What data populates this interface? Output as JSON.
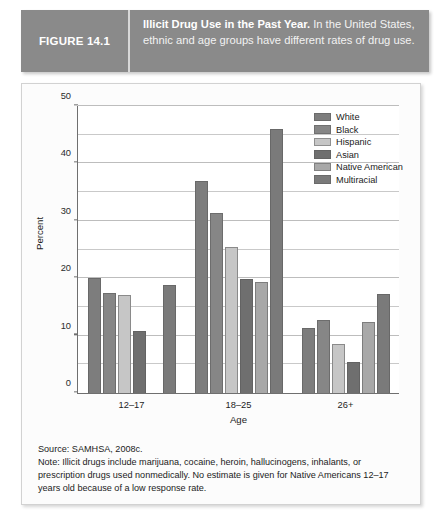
{
  "figure": {
    "label": "FIGURE 14.1",
    "caption_title": "Illicit Drug Use in the Past Year.",
    "caption_body": " In the United States, ethnic and age groups have different rates of drug use.",
    "source": "Source: SAMHSA, 2008c.",
    "note": "Note: Illicit drugs include marijuana, cocaine, heroin, hallucinogens, inhalants, or prescription drugs used nonmedically. No estimate is given for Native Americans 12–17 years old because of a low response rate."
  },
  "colors": {
    "header_band": "#8a8a8a",
    "white_series": "#7d7d7d",
    "black_series": "#868686",
    "hispanic_series": "#c6c6c6",
    "asian_series": "#6f6f6f",
    "native_american_series": "#a8a8a8",
    "multiracial_series": "#7a7a7a",
    "axis": "#6f6f6f",
    "gridline": "#c9c9c9"
  },
  "chart_data": {
    "type": "bar",
    "title": "Illicit Drug Use in the Past Year",
    "xlabel": "Age",
    "ylabel": "Percent",
    "categories": [
      "12–17",
      "18–25",
      "26+"
    ],
    "ylim": [
      0,
      50
    ],
    "yticks": [
      0,
      10,
      20,
      30,
      40,
      50
    ],
    "yticks_minor": [
      5,
      15,
      25,
      35,
      45
    ],
    "grid": true,
    "legend_position": "top-right",
    "series": [
      {
        "name": "White",
        "color": "#7d7d7d",
        "values": [
          20.0,
          36.9,
          11.4
        ]
      },
      {
        "name": "Black",
        "color": "#868686",
        "values": [
          17.5,
          31.4,
          12.7
        ]
      },
      {
        "name": "Hispanic",
        "color": "#c6c6c6",
        "values": [
          17.0,
          25.5,
          8.5
        ]
      },
      {
        "name": "Asian",
        "color": "#6f6f6f",
        "values": [
          10.8,
          19.8,
          5.4
        ]
      },
      {
        "name": "Native American",
        "color": "#a8a8a8",
        "values": [
          null,
          19.3,
          12.3
        ]
      },
      {
        "name": "Multiracial",
        "color": "#7a7a7a",
        "values": [
          18.9,
          46.0,
          17.3
        ]
      }
    ]
  }
}
